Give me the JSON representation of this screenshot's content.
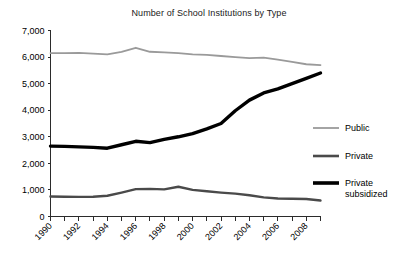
{
  "chart_data": {
    "type": "line",
    "title": "Number of School Institutions by Type",
    "xlabel": "",
    "ylabel": "",
    "ylim": [
      0,
      7000
    ],
    "xlim": [
      1990,
      2009
    ],
    "grid": false,
    "legend_position": "right",
    "ytick_labels": [
      "7,000",
      "6,000",
      "5,000",
      "4,000",
      "3,000",
      "2,000",
      "1,000",
      "0"
    ],
    "ytick_values": [
      7000,
      6000,
      5000,
      4000,
      3000,
      2000,
      1000,
      0
    ],
    "x": [
      1990,
      1991,
      1992,
      1993,
      1994,
      1995,
      1996,
      1997,
      1998,
      1999,
      2000,
      2001,
      2002,
      2003,
      2004,
      2005,
      2006,
      2007,
      2008,
      2009
    ],
    "xtick_labels": [
      "1990",
      "1992",
      "1994",
      "1996",
      "1998",
      "2000",
      "2002",
      "2004",
      "2006",
      "2008"
    ],
    "xtick_values": [
      1990,
      1992,
      1994,
      1996,
      1998,
      2000,
      2002,
      2004,
      2006,
      2008
    ],
    "series": [
      {
        "name": "Public",
        "color": "#9a9a9a",
        "width": 1.8,
        "values": [
          6150,
          6150,
          6160,
          6130,
          6100,
          6200,
          6350,
          6200,
          6180,
          6150,
          6100,
          6080,
          6040,
          6000,
          5960,
          5980,
          5900,
          5820,
          5730,
          5700
        ]
      },
      {
        "name": "Private",
        "color": "#4a4a4a",
        "width": 2.4,
        "values": [
          750,
          745,
          740,
          745,
          780,
          900,
          1030,
          1040,
          1020,
          1120,
          1000,
          950,
          900,
          860,
          800,
          720,
          680,
          670,
          660,
          600
        ]
      },
      {
        "name": "Private subsidized",
        "color": "#000000",
        "width": 3.4,
        "values": [
          2650,
          2640,
          2620,
          2600,
          2570,
          2700,
          2830,
          2780,
          2900,
          3000,
          3120,
          3300,
          3500,
          3980,
          4380,
          4650,
          4800,
          5000,
          5200,
          5400
        ]
      }
    ],
    "legend_entries": [
      {
        "label": "Public",
        "label2": "",
        "color": "#9a9a9a",
        "width": 1.8
      },
      {
        "label": "Private",
        "label2": "",
        "color": "#4a4a4a",
        "width": 2.6
      },
      {
        "label": "Private",
        "label2": "subsidized",
        "color": "#000000",
        "width": 3.6
      }
    ]
  }
}
